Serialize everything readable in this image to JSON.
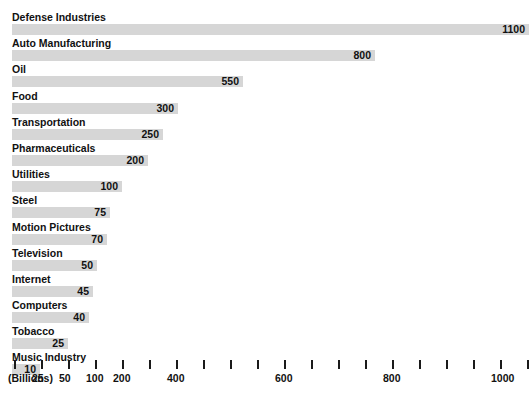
{
  "chart_data": {
    "type": "bar",
    "orientation": "horizontal",
    "title": "The Financial Universe",
    "xlabel": "(Billions)",
    "ylabel": "",
    "grid": false,
    "legend": null,
    "axis_scale": "piecewise / compressed (non-linear)",
    "categories": [
      "Defense Industries",
      "Auto Manufacturing",
      "Oil",
      "Food",
      "Transportation",
      "Pharmaceuticals",
      "Utilities",
      "Steel",
      "Motion Pictures",
      "Television",
      "Internet",
      "Computers",
      "Tobacco",
      "Music Industry"
    ],
    "values": [
      1100,
      800,
      550,
      300,
      250,
      200,
      100,
      75,
      70,
      50,
      45,
      40,
      25,
      10
    ],
    "value_labels": [
      "1100",
      "800",
      "550",
      "300",
      "250",
      "200",
      "100",
      "75",
      "70",
      "50",
      "45",
      "40",
      "25",
      "10"
    ],
    "bar_end_px": [
      529,
      375,
      243,
      178,
      163,
      148,
      122,
      110,
      107,
      97,
      93,
      89,
      68,
      40
    ],
    "bar_color": "#d6d6d6",
    "text_color": "#111111",
    "title_color": "#3b3b4f",
    "background": "#ffffff",
    "xticks_px": [
      14,
      41,
      68,
      95,
      122,
      149,
      176,
      203,
      230,
      257,
      284,
      311,
      338,
      365,
      392,
      419,
      446,
      473,
      500,
      527
    ],
    "xtick_labels": [
      {
        "text": "25",
        "px": 41
      },
      {
        "text": "50",
        "px": 68
      },
      {
        "text": "100",
        "px": 95
      },
      {
        "text": "200",
        "px": 122
      },
      {
        "text": "400",
        "px": 176
      },
      {
        "text": "600",
        "px": 284
      },
      {
        "text": "800",
        "px": 392
      },
      {
        "text": "1000",
        "px": 500
      }
    ]
  }
}
